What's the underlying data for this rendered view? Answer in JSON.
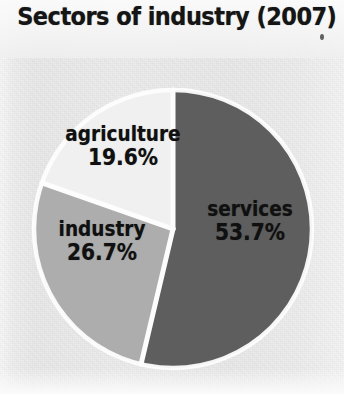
{
  "figure": {
    "title": "Sectors of industry (2007)"
  },
  "chart_data": {
    "type": "pie",
    "title": "Sectors of industry (2007)",
    "xlabel": "",
    "ylabel": "",
    "unit": "%",
    "start_angle_deg": 0,
    "direction": "clockwise",
    "legend": "none",
    "grid": false,
    "categories": [
      "services",
      "industry",
      "agriculture"
    ],
    "values": [
      53.7,
      26.7,
      19.6
    ],
    "slices": [
      {
        "label": "services",
        "value": 53.7,
        "value_text": "53.7%",
        "color": "#5e5e5e",
        "start_deg": 0,
        "end_deg": 193.3
      },
      {
        "label": "industry",
        "value": 26.7,
        "value_text": "26.7%",
        "color": "#adadad",
        "start_deg": 193.3,
        "end_deg": 289.4
      },
      {
        "label": "agriculture",
        "value": 19.6,
        "value_text": "19.6%",
        "color": "#f0f0f0",
        "start_deg": 289.4,
        "end_deg": 360
      }
    ]
  },
  "colors": {
    "background": "#ececec",
    "separator": "#fdfdfd",
    "text": "#101010",
    "services": "#5e5e5e",
    "industry": "#adadad",
    "agriculture": "#f0f0f0"
  }
}
